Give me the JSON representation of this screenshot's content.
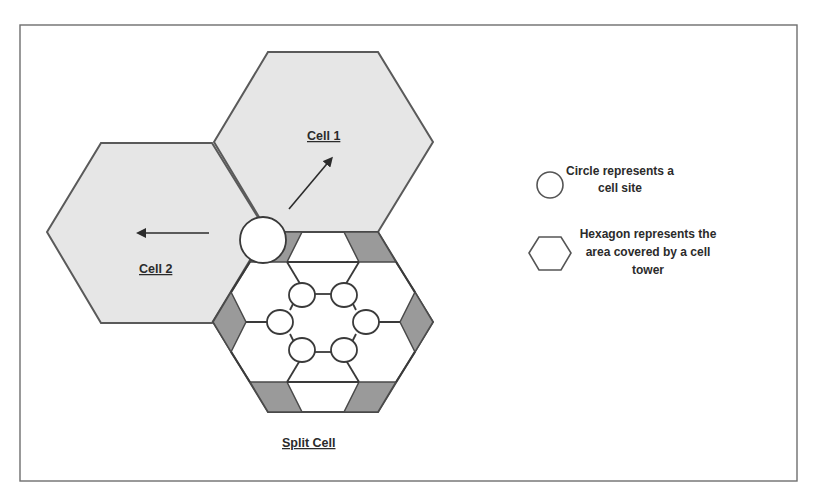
{
  "diagram": {
    "labels": {
      "cell1": "Cell 1",
      "cell2": "Cell 2",
      "split_cell": "Split Cell"
    },
    "legend": [
      {
        "icon": "circle-icon",
        "lines": [
          "Circle represents a",
          "cell site"
        ]
      },
      {
        "icon": "hexagon-icon",
        "lines": [
          "Hexagon represents the",
          "area covered by a cell",
          "tower"
        ]
      }
    ],
    "colors": {
      "cell_fill": "#e6e6e6",
      "split_dark_fill": "#9a9a9a",
      "outline": "#4a4a4a",
      "background": "#ffffff"
    }
  }
}
